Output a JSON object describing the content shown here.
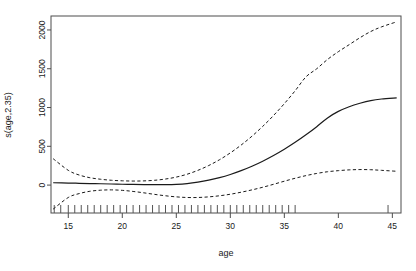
{
  "chart_data": {
    "type": "line",
    "title": "",
    "subtitle": "",
    "xlabel": "age",
    "ylabel": "s(age,2.35)",
    "xlim": [
      13.4,
      45.8
    ],
    "ylim": [
      -360,
      2180
    ],
    "grid": false,
    "legend": "none",
    "x_ticks": [
      15,
      20,
      25,
      30,
      35,
      40,
      45
    ],
    "x_tick_labels": [
      "15",
      "20",
      "25",
      "30",
      "35",
      "40",
      "45"
    ],
    "y_ticks": [
      0,
      500,
      1000,
      1500,
      2000
    ],
    "y_tick_labels": [
      "0",
      "500",
      "1000",
      "1500",
      "2000"
    ],
    "x": [
      13.6,
      15,
      16,
      17,
      18,
      19,
      20,
      21,
      22,
      23,
      24,
      25,
      26,
      27,
      28,
      29,
      30,
      31,
      32,
      33,
      34,
      35,
      36,
      37,
      38,
      39,
      40,
      41,
      42,
      43,
      44,
      45.4
    ],
    "series": [
      {
        "name": "fit",
        "style": "solid",
        "color": "#1a1a1a",
        "values": [
          30,
          26,
          23,
          20,
          17,
          14,
          11,
          8,
          6,
          5,
          6,
          10,
          20,
          38,
          63,
          96,
          137,
          186,
          243,
          308,
          381,
          462,
          551,
          648,
          753,
          866,
          950,
          1010,
          1055,
          1090,
          1110,
          1125
        ]
      },
      {
        "name": "upper confidence band",
        "style": "dashed",
        "color": "#1a1a1a",
        "values": [
          340,
          190,
          130,
          95,
          75,
          62,
          55,
          52,
          54,
          62,
          78,
          103,
          140,
          190,
          252,
          327,
          415,
          516,
          630,
          757,
          897,
          1050,
          1216,
          1395,
          1500,
          1620,
          1720,
          1810,
          1900,
          1980,
          2040,
          2105
        ]
      },
      {
        "name": "lower confidence band",
        "style": "dashed",
        "color": "#1a1a1a",
        "values": [
          -310,
          -160,
          -110,
          -80,
          -66,
          -62,
          -68,
          -82,
          -100,
          -120,
          -138,
          -152,
          -160,
          -160,
          -152,
          -138,
          -118,
          -92,
          -62,
          -28,
          10,
          50,
          88,
          122,
          150,
          172,
          186,
          196,
          200,
          198,
          190,
          178
        ]
      }
    ],
    "rug": {
      "name": "data rug marks",
      "values": [
        13.7,
        14.3,
        15.0,
        15.6,
        16.2,
        16.8,
        17.4,
        18.0,
        18.6,
        19.2,
        19.8,
        20.4,
        21.0,
        21.6,
        22.2,
        22.8,
        23.4,
        24.0,
        24.6,
        25.2,
        25.8,
        26.4,
        27.0,
        27.6,
        28.2,
        28.8,
        29.4,
        30.0,
        30.6,
        31.2,
        31.8,
        32.4,
        33.0,
        33.6,
        34.2,
        34.8,
        35.4,
        36.0,
        44.6
      ]
    }
  }
}
